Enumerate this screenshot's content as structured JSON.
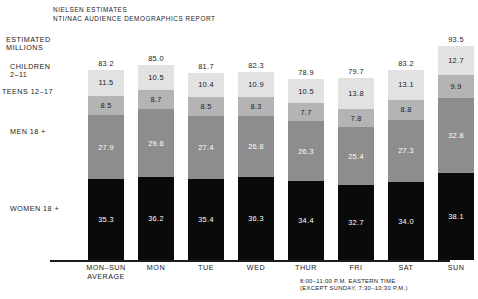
{
  "title": {
    "line1": "NIELSEN ESTIMATES",
    "line2": "NTI/NAC AUDIENCE DEMOGRAPHICS REPORT"
  },
  "axis_caption": "ESTIMATED\nMILLIONS",
  "row_labels": {
    "children": "CHILDREN\n2–11",
    "teens": "TEENS 12–17",
    "men": "MEN 18 +",
    "women": "WOMEN 18 +"
  },
  "footnote": {
    "line1": "8:00–11:00 P.M. EASTERN TIME",
    "line2": "(EXCEPT SUNDAY, 7:30–10:30 P.M.)"
  },
  "colors": {
    "children": "#e2e2e2",
    "teens": "#b4b4b4",
    "men": "#8d8d8d",
    "women": "#0a0a0a",
    "axis": "#1a1a1a",
    "background": "#ffffff"
  },
  "chart_data": {
    "type": "bar",
    "title": "NIELSEN ESTIMATES NTI/NAC AUDIENCE DEMOGRAPHICS REPORT",
    "subtitle": "8:00-11:00 P.M. EASTERN TIME (EXCEPT SUNDAY, 7:30-10:30 P.M.)",
    "stacked": true,
    "xlabel": "",
    "ylabel": "ESTIMATED MILLIONS",
    "ylim": [
      0,
      93.5
    ],
    "grid": false,
    "legend": "row-labels-left",
    "categories": [
      "MON–SUN\nAVERAGE",
      "MON",
      "TUE",
      "WED",
      "THUR",
      "FRI",
      "SAT",
      "SUN"
    ],
    "series": [
      {
        "name": "WOMEN 18 +",
        "color": "#0a0a0a",
        "values": [
          35.3,
          36.2,
          35.4,
          36.3,
          34.4,
          32.7,
          34.0,
          38.1
        ]
      },
      {
        "name": "MEN 18 +",
        "color": "#8d8d8d",
        "values": [
          27.9,
          29.6,
          27.4,
          26.8,
          26.3,
          25.4,
          27.3,
          32.8
        ]
      },
      {
        "name": "TEENS 12–17",
        "color": "#b4b4b4",
        "values": [
          8.5,
          8.7,
          8.5,
          8.3,
          7.7,
          7.8,
          8.8,
          9.9
        ]
      },
      {
        "name": "CHILDREN 2–11",
        "color": "#e2e2e2",
        "values": [
          11.5,
          10.5,
          10.4,
          10.9,
          10.5,
          13.8,
          13.1,
          12.7
        ]
      }
    ],
    "totals": [
      83.2,
      85.0,
      81.7,
      82.3,
      78.9,
      79.7,
      83.2,
      93.5
    ]
  }
}
